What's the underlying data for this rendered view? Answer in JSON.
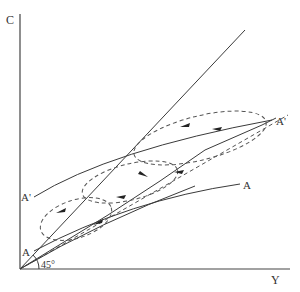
{
  "figure": {
    "type": "economics-diagram"
  },
  "axes": {
    "y_label": "C",
    "x_label": "Y",
    "angle_label": "45°"
  },
  "curves": {
    "a_prime_left_label": "A'",
    "a_prime_right_label": "A'",
    "a_left_label": "A",
    "a_right_label": "A"
  },
  "colors": {
    "line": "#3a3a3a",
    "dashed": "#555555",
    "background": "#ffffff"
  }
}
